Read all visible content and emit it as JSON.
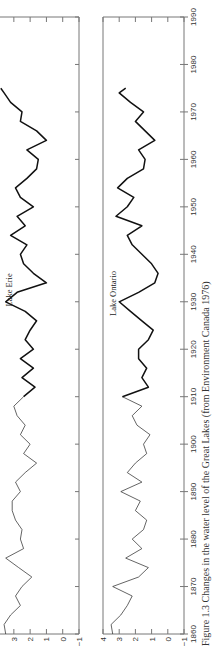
{
  "chart_data": {
    "type": "line",
    "orientation": "rotated 90 degrees counterclockwise",
    "caption": "Figure 1.3  Changes in the water level of the Great Lakes (from Environment Canada 1976)",
    "x_ticks": [
      1860,
      1870,
      1880,
      1890,
      1900,
      1910,
      1920,
      1930,
      1940,
      1950,
      1960,
      1970,
      1980,
      1990
    ],
    "xlim": [
      1860,
      1990
    ],
    "grid": false,
    "panels": [
      {
        "name": "Lake Erie",
        "label": "Lake Erie",
        "ylim": [
          -1,
          3.8
        ],
        "y_ticks": [
          -1,
          0,
          1,
          2,
          3
        ],
        "x": [
          1860,
          1862,
          1864,
          1866,
          1868,
          1870,
          1872,
          1874,
          1876,
          1878,
          1880,
          1882,
          1884,
          1886,
          1888,
          1890,
          1892,
          1894,
          1896,
          1898,
          1900,
          1902,
          1904,
          1906,
          1908,
          1910,
          1912,
          1914,
          1916,
          1918,
          1920,
          1922,
          1924,
          1926,
          1928,
          1930,
          1932,
          1934,
          1936,
          1938,
          1940,
          1942,
          1944,
          1946,
          1948,
          1950,
          1952,
          1954,
          1956,
          1958,
          1960,
          1962,
          1964,
          1966,
          1968,
          1970,
          1972,
          1974,
          1975
        ],
        "values": [
          3.5,
          3.6,
          3.2,
          2.6,
          2.9,
          2.5,
          1.9,
          2.7,
          3.5,
          2.4,
          2.6,
          2.5,
          2.9,
          3.1,
          3.1,
          2.6,
          2.9,
          2.3,
          1.6,
          2.4,
          2.0,
          2.6,
          2.3,
          2.8,
          3.0,
          2.4,
          1.7,
          2.5,
          1.8,
          2.6,
          1.8,
          2.3,
          2.0,
          1.6,
          2.3,
          3.5,
          2.8,
          1.0,
          1.8,
          2.4,
          2.6,
          2.2,
          3.2,
          2.3,
          2.8,
          1.8,
          2.6,
          2.9,
          2.2,
          1.6,
          1.5,
          2.2,
          1.0,
          1.6,
          2.6,
          2.5,
          3.2,
          3.6,
          3.8
        ],
        "line_weight_change_year": 1910
      },
      {
        "name": "Lake Ontario",
        "label": "Lake Ontario",
        "ylim": [
          -1,
          4
        ],
        "y_ticks": [
          -1,
          0,
          1,
          2,
          3,
          4
        ],
        "x": [
          1860,
          1862,
          1864,
          1866,
          1868,
          1870,
          1872,
          1874,
          1876,
          1878,
          1880,
          1882,
          1884,
          1886,
          1888,
          1890,
          1892,
          1894,
          1896,
          1898,
          1900,
          1902,
          1904,
          1906,
          1908,
          1910,
          1912,
          1914,
          1916,
          1918,
          1920,
          1922,
          1924,
          1926,
          1928,
          1930,
          1932,
          1934,
          1936,
          1938,
          1940,
          1942,
          1944,
          1946,
          1948,
          1950,
          1952,
          1954,
          1956,
          1958,
          1960,
          1962,
          1964,
          1966,
          1968,
          1970,
          1972,
          1974,
          1975
        ],
        "values": [
          3.4,
          3.5,
          2.9,
          2.5,
          2.2,
          3.4,
          1.8,
          1.2,
          2.6,
          1.6,
          2.2,
          1.5,
          1.3,
          2.0,
          1.7,
          2.9,
          1.6,
          2.5,
          2.0,
          1.3,
          1.5,
          1.1,
          1.9,
          2.2,
          1.6,
          2.8,
          1.2,
          1.6,
          1.3,
          1.8,
          1.8,
          1.2,
          0.9,
          1.6,
          2.3,
          3.0,
          1.8,
          0.8,
          0.6,
          1.0,
          1.6,
          2.2,
          2.5,
          1.6,
          3.2,
          2.5,
          2.1,
          3.1,
          2.5,
          1.5,
          1.4,
          1.8,
          0.8,
          1.4,
          2.0,
          1.5,
          2.3,
          3.0,
          2.6
        ],
        "line_weight_change_year": 1910
      }
    ]
  }
}
